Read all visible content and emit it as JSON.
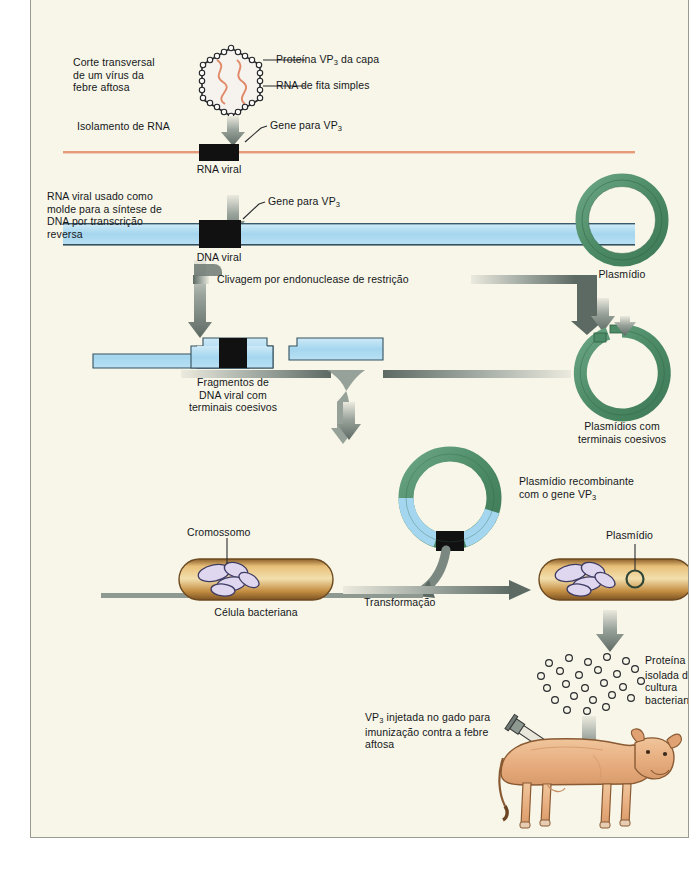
{
  "diagram": {
    "language": "pt-BR",
    "palette": {
      "background": "#f7f6e8",
      "rna_strand": "#e8a municipal",
      "rna_orange": "#e79a7a",
      "dna_blue": "#a8d8ee",
      "plasmid_green": "#4f8f68",
      "gene_black": "#111111",
      "arrow_grey": "#6f7a74",
      "bacteria_tan": "#c98f46",
      "cow_tan": "#e8b183",
      "text": "#16171b"
    },
    "steps": [
      {
        "id": "virus",
        "caption": "Corte transversal\nde um vírus da\nfebre aftosa",
        "callouts": [
          "Proteína VP",
          "RNA de fita simples"
        ],
        "callout_1_full": "Proteína VP3 da capa",
        "callout_2_full": "RNA de fita simples"
      },
      {
        "id": "rna-isolation",
        "action": "Isolamento de RNA",
        "gene_label": "Gene para VP",
        "gene_label_sub": "3",
        "product": "RNA viral"
      },
      {
        "id": "reverse-transcription",
        "action": "RNA viral usado como\nmolde para a síntese de\nDNA por transcrição\nreversa",
        "gene_label": "Gene para VP",
        "gene_label_sub": "3",
        "product": "DNA viral"
      },
      {
        "id": "restriction-digest",
        "action": "Clivagem por endonuclease de restrição",
        "product_left": "Fragmentos de\nDNA viral com\nterminais coesivos",
        "product_right": "Plasmídios com\nterminais coesivos"
      },
      {
        "id": "plasmid",
        "label": "Plasmídio"
      },
      {
        "id": "recombinant",
        "label": "Plasmídio recombinante\ncom o gene VP",
        "label_sub": "3"
      },
      {
        "id": "bacterial-cell",
        "label": "Célula bacteriana",
        "chromosome_label": "Cromossomo",
        "plasmid_label": "Plasmídio",
        "action": "Transformação"
      },
      {
        "id": "protein-isolation",
        "label": "Proteína VP",
        "label_sub": "3",
        "label_rest": "isolada da\ncultura\nbacteriana"
      },
      {
        "id": "immunization",
        "label": "VP",
        "label_sub": "3",
        "label_rest": " injetada no gado para\nimunização contra a febre\naftosa"
      }
    ],
    "labels": {
      "virus_caption": "Corte transversal\nde um vírus da\nfebre aftosa",
      "callout_coat_protein": "Proteína VP",
      "callout_coat_protein_sub": "3",
      "callout_coat_protein_rest": " da capa",
      "callout_rna": "RNA de fita simples",
      "isolation_rna": "Isolamento de RNA",
      "gene_for_vp3": "Gene para VP",
      "gene_for_vp3_sub": "3",
      "rna_viral": "RNA viral",
      "reverse_transcription": "RNA viral usado como\nmolde para a síntese de\nDNA por transcrição\nreversa",
      "dna_viral": "DNA viral",
      "plasmid": "Plasmídio",
      "cleavage": "Clivagem por endonuclease de restrição",
      "fragments": "Fragmentos de\nDNA viral com\nterminais coesivos",
      "plasmids_sticky": "Plasmídios com\nterminais coesivos",
      "recombinant_plasmid": "Plasmídio recombinante\ncom o gene VP",
      "recombinant_plasmid_sub": "3",
      "chromosome": "Cromossomo",
      "bacterial_cell": "Célula bacteriana",
      "transformation": "Transformação",
      "plasmid_in_cell": "Plasmídio",
      "protein_isolated": "Proteína VP",
      "protein_isolated_sub": "3",
      "protein_isolated_rest": "isolada da\ncultura\nbacteriana",
      "injection": "VP",
      "injection_sub": "3",
      "injection_rest": " injetada no gado para\nimunização contra a febre\naftosa"
    }
  }
}
